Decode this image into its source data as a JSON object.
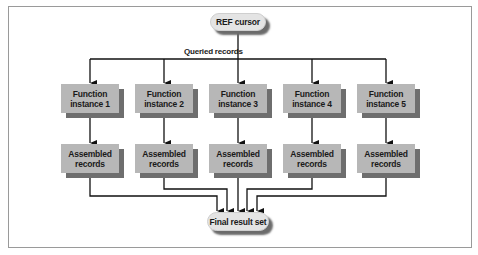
{
  "diagram": {
    "source_node": {
      "label": "REF cursor"
    },
    "edge_label": "Queried records",
    "function_instances": [
      {
        "label": "Function instance 1"
      },
      {
        "label": "Function instance 2"
      },
      {
        "label": "Function instance 3"
      },
      {
        "label": "Function instance 4"
      },
      {
        "label": "Function instance 5"
      }
    ],
    "assembled_nodes": [
      {
        "label": "Assembled records"
      },
      {
        "label": "Assembled records"
      },
      {
        "label": "Assembled records"
      },
      {
        "label": "Assembled records"
      },
      {
        "label": "Assembled records"
      }
    ],
    "sink_node": {
      "label": "Final result set"
    },
    "colors": {
      "box_fill": "#b7b7b7",
      "box_shadow": "#6e6e6e",
      "pill_fill": "#e4e4e4",
      "line": "#111111",
      "frame": "#9a9a9a"
    }
  }
}
